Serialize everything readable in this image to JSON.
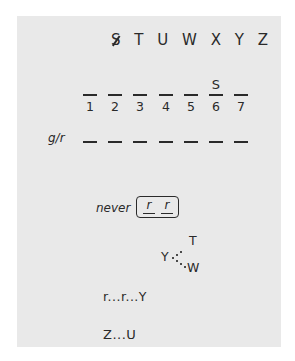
{
  "puzzle": {
    "letter_pool": {
      "crossed_out": "S",
      "remaining": [
        "T",
        "U",
        "W",
        "X",
        "Y",
        "Z"
      ]
    },
    "slots": [
      {
        "number": "1",
        "value": ""
      },
      {
        "number": "2",
        "value": ""
      },
      {
        "number": "3",
        "value": ""
      },
      {
        "number": "4",
        "value": ""
      },
      {
        "number": "5",
        "value": ""
      },
      {
        "number": "6",
        "value": "S"
      },
      {
        "number": "7",
        "value": ""
      }
    ],
    "gr_row": {
      "label": "g/r",
      "dash_count": 7
    },
    "never_rule": {
      "label": "never",
      "boxed": [
        "r",
        "r"
      ]
    },
    "diagram": {
      "center": "Y",
      "top": "T",
      "bottom": "W"
    },
    "sequences": [
      {
        "text": "r...r...Y"
      },
      {
        "text": "Z...U"
      }
    ]
  },
  "colors": {
    "panel_background": "#e9e9e9",
    "ink": "#2a2a2a",
    "page_background": "#ffffff"
  }
}
